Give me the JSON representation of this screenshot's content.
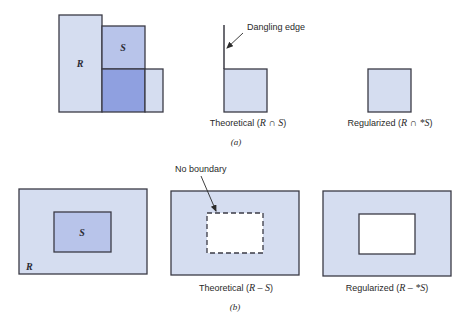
{
  "colors": {
    "light_fill": "#d5ddf0",
    "mid_fill": "#b8c4ea",
    "dark_fill": "#8fa0e0",
    "stroke": "#3b3b45",
    "hole": "#ffffff"
  },
  "part_a": {
    "label": "(a)",
    "operands": {
      "r_label": "R",
      "s_label": "S"
    },
    "theoretical": {
      "annotation": "Dangling edge",
      "caption_prefix": "Theoretical (",
      "caption_expr": "R ∩ S",
      "caption_suffix": ")"
    },
    "regularized": {
      "caption_prefix": "Regularized (",
      "caption_expr": "R ∩ *S",
      "caption_suffix": ")"
    }
  },
  "part_b": {
    "label": "(b)",
    "operands": {
      "r_label": "R",
      "s_label": "S"
    },
    "theoretical": {
      "annotation": "No boundary",
      "caption_prefix": "Theoretical (",
      "caption_expr": "R – S",
      "caption_suffix": ")"
    },
    "regularized": {
      "caption_prefix": "Regularized (",
      "caption_expr": "R – *S",
      "caption_suffix": ")"
    }
  }
}
